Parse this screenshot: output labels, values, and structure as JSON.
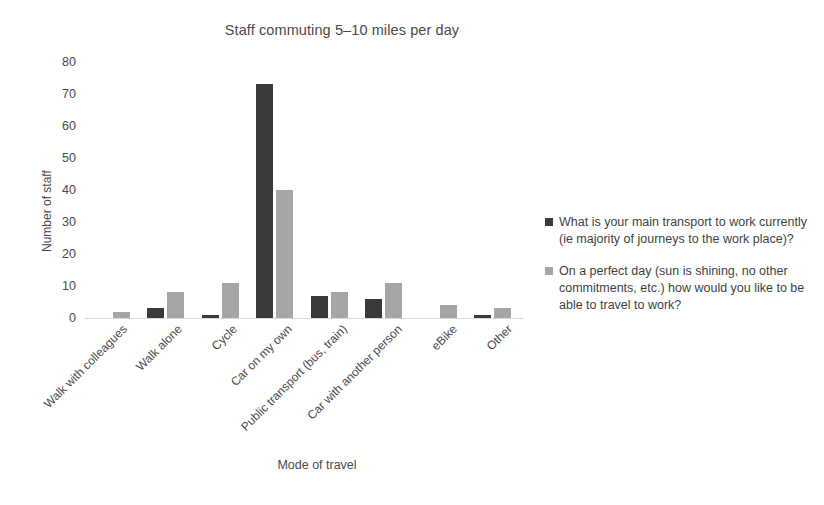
{
  "chart_data": {
    "type": "bar",
    "title": "Staff commuting 5–10 miles per day",
    "xlabel": "Mode of travel",
    "ylabel": "Number of staff",
    "ylim": [
      0,
      80
    ],
    "yticks": [
      0,
      10,
      20,
      30,
      40,
      50,
      60,
      70,
      80
    ],
    "grid": false,
    "legend_position": "right",
    "categories": [
      "Walk with colleagues",
      "Walk alone",
      "Cycle",
      "Car on my own",
      "Public transport (bus, train)",
      "Car with another person",
      "eBike",
      "Other"
    ],
    "series": [
      {
        "name": "What is your main transport to work currently (ie majority of journeys to the work place)?",
        "color": "#3a3a3a",
        "values": [
          0,
          3,
          1,
          73,
          7,
          6,
          0,
          1
        ]
      },
      {
        "name": "On a perfect day (sun is shining, no other commitments, etc.) how would you like to be able to travel to work?",
        "color": "#a6a6a6",
        "values": [
          2,
          8,
          11,
          40,
          8,
          11,
          4,
          3
        ]
      }
    ]
  },
  "colors": {
    "series_0": "#3a3a3a",
    "series_1": "#a6a6a6",
    "axis": "#d9d9d9",
    "text": "#4a4a4a",
    "background": "#ffffff"
  }
}
